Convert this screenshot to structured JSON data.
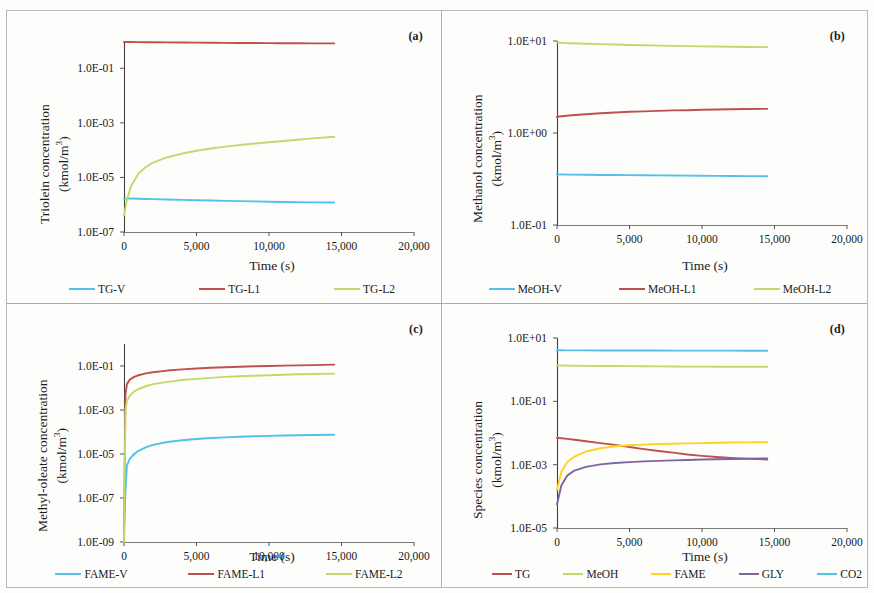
{
  "figure": {
    "panels": [
      "a",
      "b",
      "c",
      "d"
    ]
  },
  "colors": {
    "vapor_cyan": "#4FC3E8",
    "liquid1_red": "#C0504D",
    "liquid2_green": "#C3D96B",
    "fame_yellow": "#FFD320",
    "gly_purple": "#8064A2",
    "co2_cyan": "#4FC3E8",
    "axis": "#595959",
    "frame": "#b9b9b9"
  },
  "panel_a": {
    "tag": "(a)",
    "ytitle_line1": "Triolein concentration",
    "ytitle_line2": "(kmol/m",
    "ytitle_sup": "3",
    "ytitle_line2_end": ")",
    "xtitle": "Time (s)",
    "yticks": [
      "1.0E-01",
      "1.0E-03",
      "1.0E-05",
      "1.0E-07"
    ],
    "xticks": [
      "0",
      "5,000",
      "10,000",
      "15,000",
      "20,000"
    ],
    "legend": [
      {
        "label": "TG-V",
        "color": "#4FC3E8"
      },
      {
        "label": "TG-L1",
        "color": "#C0504D"
      },
      {
        "label": "TG-L2",
        "color": "#C3D96B"
      }
    ]
  },
  "panel_b": {
    "tag": "(b)",
    "ytitle_line1": "Methanol concentration",
    "ytitle_line2": "(kmol/m",
    "ytitle_sup": "3",
    "ytitle_line2_end": ")",
    "xtitle": "Time (s)",
    "yticks": [
      "1.0E+01",
      "1.0E+00",
      "1.0E-01"
    ],
    "xticks": [
      "0",
      "5,000",
      "10,000",
      "15,000",
      "20,000"
    ],
    "legend": [
      {
        "label": "MeOH-V",
        "color": "#4FC3E8"
      },
      {
        "label": "MeOH-L1",
        "color": "#C0504D"
      },
      {
        "label": "MeOH-L2",
        "color": "#C3D96B"
      }
    ]
  },
  "panel_c": {
    "tag": "(c)",
    "ytitle_line1": "Methyl-oleate concentration",
    "ytitle_line2": "(kmol/m",
    "ytitle_sup": "3",
    "ytitle_line2_end": ")",
    "xtitle": "Time (s)",
    "yticks": [
      "1.0E-01",
      "1.0E-03",
      "1.0E-05",
      "1.0E-07",
      "1.0E-09"
    ],
    "xticks": [
      "0",
      "5,000",
      "10,000",
      "15,000",
      "20,000"
    ],
    "legend": [
      {
        "label": "FAME-V",
        "color": "#4FC3E8"
      },
      {
        "label": "FAME-L1",
        "color": "#C0504D"
      },
      {
        "label": "FAME-L2",
        "color": "#C3D96B"
      }
    ]
  },
  "panel_d": {
    "tag": "(d)",
    "ytitle_line1": "Species concentration",
    "ytitle_line2": "(kmol/m",
    "ytitle_sup": "3",
    "ytitle_line2_end": ")",
    "xtitle": "Time (s)",
    "yticks": [
      "1.0E+01",
      "1.0E-01",
      "1.0E-03",
      "1.0E-05"
    ],
    "xticks": [
      "0",
      "5,000",
      "10,000",
      "15,000",
      "20,000"
    ],
    "legend": [
      {
        "label": "TG",
        "color": "#C0504D"
      },
      {
        "label": "MeOH",
        "color": "#C3D96B"
      },
      {
        "label": "FAME",
        "color": "#FFD320"
      },
      {
        "label": "GLY",
        "color": "#8064A2"
      },
      {
        "label": "CO2",
        "color": "#4FC3E8"
      }
    ]
  },
  "chart_data": [
    {
      "id": "a",
      "type": "line",
      "title": "",
      "panel_label": "(a)",
      "xlabel": "Time (s)",
      "ylabel": "Triolein concentration (kmol/m3)",
      "yscale": "log",
      "xlim": [
        0,
        20000
      ],
      "ylim": [
        1e-07,
        1.0
      ],
      "ytick_values": [
        0.1,
        0.001,
        1e-05,
        1e-07
      ],
      "ytick_labels": [
        "1.0E-01",
        "1.0E-03",
        "1.0E-05",
        "1.0E-07"
      ],
      "xtick_values": [
        0,
        5000,
        10000,
        15000,
        20000
      ],
      "xtick_labels": [
        "0",
        "5,000",
        "10,000",
        "15,000",
        "20,000"
      ],
      "grid": false,
      "legend_position": "bottom",
      "x": [
        0,
        200,
        500,
        1000,
        1500,
        2000,
        3000,
        4000,
        5000,
        6000,
        7000,
        8000,
        9000,
        10000,
        11000,
        12000,
        13000,
        14500
      ],
      "series": [
        {
          "name": "TG-V",
          "color": "#4FC3E8",
          "values": [
            1.7e-06,
            1.7e-06,
            1.68e-06,
            1.65e-06,
            1.62e-06,
            1.6e-06,
            1.55e-06,
            1.5e-06,
            1.46e-06,
            1.42e-06,
            1.38e-06,
            1.35e-06,
            1.32e-06,
            1.29e-06,
            1.26e-06,
            1.24e-06,
            1.22e-06,
            1.2e-06
          ]
        },
        {
          "name": "TG-L1",
          "color": "#C0504D",
          "values": [
            0.92,
            0.92,
            0.915,
            0.91,
            0.905,
            0.9,
            0.89,
            0.88,
            0.87,
            0.862,
            0.855,
            0.848,
            0.842,
            0.836,
            0.83,
            0.825,
            0.82,
            0.815
          ]
        },
        {
          "name": "TG-L2",
          "color": "#C3D96B",
          "values": [
            4e-07,
            1.5e-06,
            5e-06,
            1.4e-05,
            2.4e-05,
            3.5e-05,
            5.5e-05,
            7.5e-05,
            9.5e-05,
            0.000115,
            0.000135,
            0.000155,
            0.000175,
            0.000195,
            0.000215,
            0.00024,
            0.00027,
            0.00031
          ]
        }
      ]
    },
    {
      "id": "b",
      "type": "line",
      "panel_label": "(b)",
      "xlabel": "Time (s)",
      "ylabel": "Methanol concentration (kmol/m3)",
      "yscale": "log",
      "xlim": [
        0,
        20000
      ],
      "ylim": [
        0.1,
        10
      ],
      "ytick_values": [
        10,
        1,
        0.1
      ],
      "ytick_labels": [
        "1.0E+01",
        "1.0E+00",
        "1.0E-01"
      ],
      "xtick_values": [
        0,
        5000,
        10000,
        15000,
        20000
      ],
      "xtick_labels": [
        "0",
        "5,000",
        "10,000",
        "15,000",
        "20,000"
      ],
      "grid": false,
      "legend_position": "bottom",
      "x": [
        0,
        500,
        1000,
        2000,
        3000,
        4000,
        5000,
        6000,
        7000,
        8000,
        9000,
        10000,
        11000,
        12000,
        13000,
        14500
      ],
      "series": [
        {
          "name": "MeOH-V",
          "color": "#4FC3E8",
          "values": [
            0.355,
            0.354,
            0.353,
            0.352,
            0.35,
            0.349,
            0.348,
            0.347,
            0.346,
            0.345,
            0.344,
            0.343,
            0.342,
            0.341,
            0.34,
            0.339
          ]
        },
        {
          "name": "MeOH-L1",
          "color": "#C0504D",
          "values": [
            1.5,
            1.53,
            1.56,
            1.6,
            1.64,
            1.67,
            1.7,
            1.72,
            1.74,
            1.76,
            1.77,
            1.79,
            1.8,
            1.81,
            1.82,
            1.83
          ]
        },
        {
          "name": "MeOH-L2",
          "color": "#C3D96B",
          "values": [
            9.6,
            9.5,
            9.45,
            9.35,
            9.25,
            9.15,
            9.05,
            8.98,
            8.9,
            8.85,
            8.8,
            8.75,
            8.7,
            8.66,
            8.62,
            8.58
          ]
        }
      ]
    },
    {
      "id": "c",
      "type": "line",
      "panel_label": "(c)",
      "xlabel": "Time (s)",
      "ylabel": "Methyl-oleate concentration (kmol/m3)",
      "yscale": "log",
      "xlim": [
        0,
        20000
      ],
      "ylim": [
        1e-09,
        1.0
      ],
      "ytick_values": [
        0.1,
        0.001,
        1e-05,
        1e-07,
        1e-09
      ],
      "ytick_labels": [
        "1.0E-01",
        "1.0E-03",
        "1.0E-05",
        "1.0E-07",
        "1.0E-09"
      ],
      "xtick_values": [
        0,
        5000,
        10000,
        15000,
        20000
      ],
      "xtick_labels": [
        "0",
        "5,000",
        "10,000",
        "15,000",
        "20,000"
      ],
      "grid": false,
      "legend_position": "bottom",
      "x": [
        0,
        100,
        200,
        400,
        700,
        1000,
        1500,
        2000,
        3000,
        4000,
        5000,
        6000,
        7000,
        8000,
        9000,
        10000,
        11000,
        12000,
        13000,
        14500
      ],
      "series": [
        {
          "name": "FAME-V",
          "color": "#4FC3E8",
          "values": [
            4e-09,
            2e-07,
            3e-06,
            6e-06,
            1e-05,
            1.4e-05,
            2e-05,
            2.6e-05,
            3.5e-05,
            4.2e-05,
            4.8e-05,
            5.3e-05,
            5.7e-05,
            6.1e-05,
            6.4e-05,
            6.7e-05,
            6.9e-05,
            7.1e-05,
            7.3e-05,
            7.5e-05
          ]
        },
        {
          "name": "FAME-L1",
          "color": "#C0504D",
          "values": [
            1e-09,
            0.005,
            0.015,
            0.024,
            0.032,
            0.038,
            0.046,
            0.052,
            0.062,
            0.07,
            0.077,
            0.083,
            0.088,
            0.093,
            0.097,
            0.1,
            0.104,
            0.107,
            0.11,
            0.115
          ]
        },
        {
          "name": "FAME-L2",
          "color": "#C3D96B",
          "values": [
            1e-09,
            0.001,
            0.0025,
            0.0045,
            0.007,
            0.009,
            0.012,
            0.015,
            0.019,
            0.023,
            0.026,
            0.029,
            0.032,
            0.034,
            0.036,
            0.038,
            0.04,
            0.042,
            0.043,
            0.045
          ]
        }
      ]
    },
    {
      "id": "d",
      "type": "line",
      "panel_label": "(d)",
      "xlabel": "Time (s)",
      "ylabel": "Species concentration (kmol/m3)",
      "yscale": "log",
      "xlim": [
        0,
        20000
      ],
      "ylim": [
        1e-05,
        10
      ],
      "ytick_values": [
        10,
        0.1,
        0.001,
        1e-05
      ],
      "ytick_labels": [
        "1.0E+01",
        "1.0E-01",
        "1.0E-03",
        "1.0E-05"
      ],
      "xtick_values": [
        0,
        5000,
        10000,
        15000,
        20000
      ],
      "xtick_labels": [
        "0",
        "5,000",
        "10,000",
        "15,000",
        "20,000"
      ],
      "grid": false,
      "legend_position": "bottom",
      "x": [
        0,
        300,
        700,
        1200,
        2000,
        3000,
        4000,
        5000,
        6000,
        7000,
        8000,
        9000,
        10000,
        11000,
        12000,
        13000,
        14500
      ],
      "series": [
        {
          "name": "TG",
          "color": "#C0504D",
          "values": [
            0.007,
            0.0068,
            0.0065,
            0.0061,
            0.0055,
            0.0048,
            0.0042,
            0.0036,
            0.0031,
            0.0027,
            0.0024,
            0.0021,
            0.0019,
            0.00175,
            0.00163,
            0.00155,
            0.00145
          ]
        },
        {
          "name": "MeOH",
          "color": "#C3D96B",
          "values": [
            1.35,
            1.35,
            1.34,
            1.33,
            1.32,
            1.31,
            1.3,
            1.29,
            1.28,
            1.27,
            1.26,
            1.25,
            1.25,
            1.24,
            1.24,
            1.23,
            1.23
          ]
        },
        {
          "name": "FAME",
          "color": "#FFD320",
          "values": [
            0.00016,
            0.0006,
            0.0012,
            0.0018,
            0.0026,
            0.0033,
            0.0038,
            0.0041,
            0.0043,
            0.0045,
            0.0046,
            0.0047,
            0.0048,
            0.0049,
            0.005,
            0.00505,
            0.0051
          ]
        },
        {
          "name": "GLY",
          "color": "#8064A2",
          "values": [
            5.5e-05,
            0.00022,
            0.00045,
            0.00065,
            0.00085,
            0.00102,
            0.00113,
            0.0012,
            0.00127,
            0.00132,
            0.00137,
            0.00141,
            0.00145,
            0.00148,
            0.00151,
            0.00154,
            0.00157
          ]
        },
        {
          "name": "CO2",
          "color": "#4FC3E8",
          "values": [
            4.1,
            4.1,
            4.08,
            4.07,
            4.06,
            4.05,
            4.04,
            4.03,
            4.02,
            4.01,
            4.0,
            4.0,
            3.99,
            3.98,
            3.98,
            3.97,
            3.96
          ]
        }
      ]
    }
  ]
}
